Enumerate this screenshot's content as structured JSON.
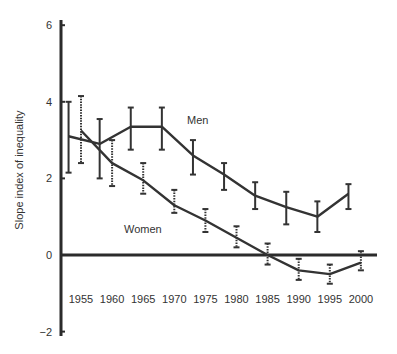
{
  "chart_data": {
    "type": "line",
    "title": "",
    "xlabel": "",
    "ylabel": "Slope index of inequality",
    "xlim": [
      1951,
      2003
    ],
    "ylim": [
      -2,
      6
    ],
    "x_ticks": [
      "1955",
      "1960",
      "1965",
      "1970",
      "1975",
      "1980",
      "1985",
      "1990",
      "1995",
      "2000"
    ],
    "y_ticks": [
      "6",
      "4",
      "2",
      "0",
      "−2"
    ],
    "y_tick_values": [
      6,
      4,
      2,
      0,
      -2
    ],
    "grid": false,
    "legend": "inline labels",
    "series": [
      {
        "name": "Men",
        "label": "Men",
        "line_style": "solid",
        "error_bar_style": "solid",
        "x": [
          1953,
          1958,
          1963,
          1968,
          1973,
          1978,
          1983,
          1988,
          1993,
          1998
        ],
        "values": [
          3.1,
          2.9,
          3.35,
          3.35,
          2.6,
          2.1,
          1.55,
          1.25,
          1.0,
          1.6
        ],
        "lower": [
          2.15,
          2.0,
          2.75,
          2.75,
          2.1,
          1.7,
          1.2,
          0.8,
          0.6,
          1.2
        ],
        "upper": [
          4.0,
          3.55,
          3.85,
          3.85,
          3.0,
          2.4,
          1.9,
          1.65,
          1.4,
          1.85
        ]
      },
      {
        "name": "Women",
        "label": "Women",
        "line_style": "solid",
        "error_bar_style": "dotted",
        "x": [
          1955,
          1960,
          1965,
          1970,
          1975,
          1980,
          1985,
          1990,
          1995,
          2000
        ],
        "values": [
          3.25,
          2.4,
          1.95,
          1.3,
          0.9,
          0.45,
          0.0,
          -0.4,
          -0.5,
          -0.2
        ],
        "lower": [
          2.4,
          1.8,
          1.6,
          1.1,
          0.6,
          0.2,
          -0.25,
          -0.65,
          -0.75,
          -0.4
        ],
        "upper": [
          4.15,
          3.0,
          2.4,
          1.7,
          1.2,
          0.75,
          0.3,
          -0.1,
          -0.25,
          0.1
        ]
      }
    ],
    "annotations": [
      {
        "text": "Men",
        "x": 1972,
        "y": 3.5
      },
      {
        "text": "Women",
        "x": 1966,
        "y": 0.65
      }
    ]
  },
  "colors": {
    "line": "#333333",
    "axis": "#2b2b2b",
    "text": "#333333",
    "background": "#ffffff"
  }
}
